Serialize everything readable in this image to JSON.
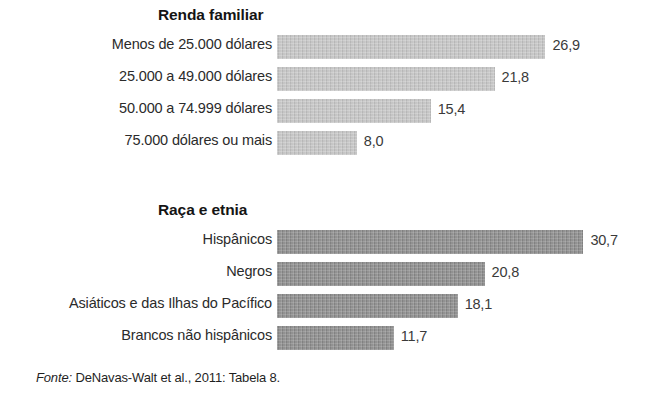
{
  "figure": {
    "bar_origin_x": 277,
    "px_per_unit": 9.98,
    "value_gap": 7
  },
  "source": {
    "prefix": "Fonte:",
    "text": " DeNavas-Walt et al., 2011: Tabela 8."
  },
  "chart_data": {
    "type": "bar",
    "orientation": "horizontal",
    "title": "",
    "xlabel": "",
    "ylabel": "",
    "grid": false,
    "legend": false,
    "axis_visible": false,
    "value_format": "comma-decimal",
    "xlim": [
      0,
      30.7
    ],
    "groups": [
      {
        "title": "Renda familiar",
        "bar_color": "#c6c6c6",
        "categories": [
          "Menos de 25.000 dólares",
          "25.000 a 49.000 dólares",
          "50.000 a 74.999 dólares",
          "75.000 dólares ou mais"
        ],
        "values": [
          26.9,
          21.8,
          15.4,
          8.0
        ],
        "value_labels": [
          "26,9",
          "21,8",
          "15,4",
          "8,0"
        ]
      },
      {
        "title": "Raça e etnia",
        "bar_color": "#8c8c8c",
        "categories": [
          "Hispânicos",
          "Negros",
          "Asiáticos e das Ilhas do Pacífico",
          "Brancos não hispânicos"
        ],
        "values": [
          30.7,
          20.8,
          18.1,
          11.7
        ],
        "value_labels": [
          "30,7",
          "20,8",
          "18,1",
          "11,7"
        ]
      }
    ]
  }
}
